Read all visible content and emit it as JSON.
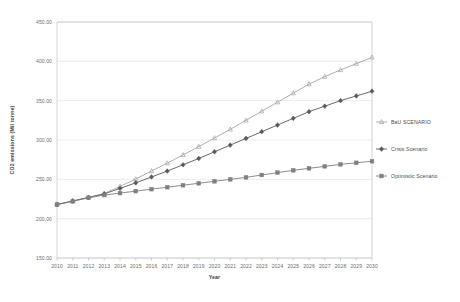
{
  "chart_data": {
    "type": "line",
    "title": "",
    "xlabel": "Year",
    "ylabel": "CO2 emissions (Mil tonne)",
    "xlim": [
      2010,
      2030
    ],
    "ylim": [
      150.0,
      450.0
    ],
    "grid": true,
    "legend_position": "right",
    "y_ticks": [
      "150.00",
      "200.00",
      "250.00",
      "300.00",
      "350.00",
      "400.00",
      "450.00"
    ],
    "y_tick_values": [
      150,
      200,
      250,
      300,
      350,
      400,
      450
    ],
    "categories": [
      2010,
      2011,
      2012,
      2013,
      2014,
      2015,
      2016,
      2017,
      2018,
      2019,
      2020,
      2021,
      2022,
      2023,
      2024,
      2025,
      2026,
      2027,
      2028,
      2029,
      2030
    ],
    "x_tick_labels": [
      "2010",
      "2011",
      "2012",
      "2013",
      "2014",
      "2015",
      "2016",
      "2017",
      "2018",
      "2019",
      "2020",
      "2021",
      "2022",
      "2023",
      "2024",
      "2025",
      "2026",
      "2027",
      "2028",
      "2029",
      "2030"
    ],
    "series": [
      {
        "name": "BaU SCENARIO",
        "color": "#a6a6a6",
        "marker": "triangle",
        "values": [
          218.0,
          222.5,
          227.0,
          232.0,
          241.0,
          250.5,
          260.5,
          270.5,
          281.0,
          291.5,
          302.5,
          313.5,
          325.0,
          336.5,
          348.0,
          359.5,
          371.0,
          380.5,
          389.0,
          397.0,
          405.0
        ]
      },
      {
        "name": "Crisis Scenario",
        "color": "#595959",
        "marker": "diamond",
        "values": [
          218.0,
          222.5,
          227.0,
          231.5,
          238.5,
          245.5,
          253.0,
          260.5,
          268.5,
          276.5,
          285.0,
          293.5,
          302.0,
          310.5,
          319.0,
          327.5,
          336.0,
          343.0,
          350.0,
          356.0,
          362.0
        ]
      },
      {
        "name": "Optimistic Scenario",
        "color": "#7f7f7f",
        "marker": "square",
        "values": [
          218.0,
          222.0,
          226.5,
          230.0,
          232.5,
          235.0,
          237.5,
          240.0,
          242.5,
          245.0,
          247.5,
          250.0,
          252.5,
          255.5,
          258.5,
          261.5,
          264.0,
          266.5,
          269.0,
          271.0,
          273.0
        ]
      }
    ]
  },
  "colors": {
    "gridline": "#d9d9d9",
    "axis": "#b5b5b5",
    "text": "#6b6b6b",
    "title_text": "#3d3d3d"
  }
}
